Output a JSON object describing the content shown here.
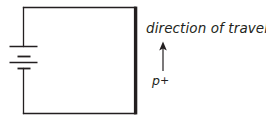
{
  "figure": {
    "type": "circuit-diagram",
    "width": 266,
    "height": 124,
    "background_color": "#ffffff",
    "stroke_color": "#231f20",
    "labels": {
      "direction_of_travel": "direction of travel",
      "particle": "p",
      "particle_charge": "+"
    },
    "components": [
      {
        "name": "circuit-loop",
        "shape": "rectangle",
        "stroke_width": 1.3,
        "x": 23.5,
        "y": 7.5,
        "width": 112,
        "height": 106
      },
      {
        "name": "battery-symbol",
        "cells": 2,
        "long_plate_width": 28,
        "short_plate_width": 13,
        "plate_y_positions": [
          46.5,
          56.5,
          62.5,
          68.5
        ]
      },
      {
        "name": "accelerator-plate",
        "shape": "thick-vertical-bar",
        "x": 135.5,
        "y_top": 7,
        "y_bottom": 114,
        "stroke_width": 3.4
      },
      {
        "name": "travel-arrow",
        "direction": "up",
        "x": 163,
        "y_tail": 71,
        "y_head": 42,
        "stroke_width": 1.2
      }
    ]
  }
}
